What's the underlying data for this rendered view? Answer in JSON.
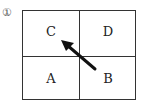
{
  "item_number": "①",
  "cells": {
    "top_left": "C",
    "top_right": "D",
    "bottom_left": "A",
    "bottom_right": "B"
  },
  "arrow": {
    "from_cell": "B",
    "to_cell": "C",
    "direction": "up-left",
    "color": "#111111"
  }
}
